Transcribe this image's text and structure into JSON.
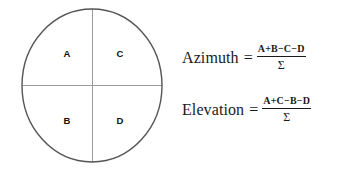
{
  "diagram": {
    "shape": "ellipse",
    "outline_color": "#555555",
    "divider_color": "#9a9a9a",
    "label_color": "#111111",
    "quadrants": [
      {
        "id": "top-left",
        "label": "A"
      },
      {
        "id": "top-right",
        "label": "C"
      },
      {
        "id": "bottom-left",
        "label": "B"
      },
      {
        "id": "bottom-right",
        "label": "D"
      }
    ]
  },
  "formulas": {
    "text_color": "#1a1a1a",
    "azimuth": {
      "name": "Azimuth",
      "equals": "=",
      "numerator": "A+B−C−D",
      "denominator": "Σ"
    },
    "elevation": {
      "name": "Elevation",
      "equals": "=",
      "numerator": "A+C−B−D",
      "denominator": "Σ"
    }
  }
}
